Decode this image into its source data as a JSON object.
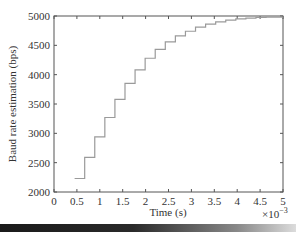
{
  "chart_data": {
    "type": "line",
    "style": "step",
    "title": "",
    "xlabel": "Time (s)",
    "ylabel": "Baud rate estimation (bps)",
    "x_multiplier_label": "×10",
    "x_multiplier_exp": "−3",
    "xlim": [
      0,
      5
    ],
    "ylim": [
      2000,
      5000
    ],
    "x_ticks": [
      "0",
      "0.5",
      "1",
      "1.5",
      "2",
      "2.5",
      "3",
      "3.5",
      "4",
      "4.5",
      "5"
    ],
    "y_ticks": [
      "2000",
      "2500",
      "3000",
      "3500",
      "4000",
      "4500",
      "5000"
    ],
    "grid": false,
    "legend": null,
    "line_color": "#9a9a9a",
    "series": [
      {
        "name": "Baud rate estimation",
        "x": [
          0.45,
          0.67,
          0.89,
          1.11,
          1.33,
          1.55,
          1.77,
          1.99,
          2.21,
          2.43,
          2.65,
          2.87,
          3.09,
          3.31,
          3.53,
          3.75,
          3.97,
          4.19,
          4.41,
          4.63,
          5.0
        ],
        "values": [
          2230,
          2590,
          2940,
          3270,
          3580,
          3850,
          4080,
          4280,
          4430,
          4560,
          4660,
          4740,
          4810,
          4860,
          4900,
          4930,
          4950,
          4965,
          4975,
          4982,
          4985
        ]
      }
    ]
  }
}
